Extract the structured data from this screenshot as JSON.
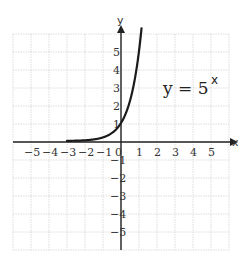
{
  "chart_data": {
    "type": "line",
    "title": "",
    "xlabel": "x",
    "ylabel": "y",
    "xlim": [
      -6,
      6
    ],
    "ylim": [
      -6,
      6
    ],
    "grid": true,
    "x_ticks": [
      "−5",
      "−4",
      "−3",
      "−2",
      "−1",
      "0",
      "1",
      "2",
      "3",
      "4",
      "5"
    ],
    "y_ticks": [
      "5",
      "4",
      "3",
      "2",
      "1",
      "−1",
      "−2",
      "−3",
      "−4",
      "−5"
    ],
    "series": [
      {
        "name": "y = 5^x",
        "function": "5^x",
        "x": [
          -3,
          -2,
          -1,
          -0.5,
          0,
          0.5,
          1,
          1.1
        ],
        "y": [
          0.008,
          0.04,
          0.2,
          0.447,
          1,
          2.236,
          5,
          5.87
        ]
      }
    ],
    "annotations": [
      {
        "text": "y = 5",
        "superscript": "x",
        "position": [
          2.5,
          3.3
        ]
      }
    ]
  },
  "labels": {
    "equation_base": "y = 5",
    "equation_exp": "x",
    "x_axis": "x",
    "y_axis": "y"
  }
}
